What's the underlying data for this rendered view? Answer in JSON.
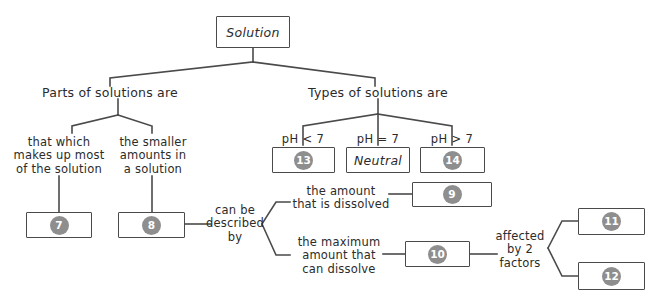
{
  "diagram": {
    "root": {
      "text": "Solution"
    },
    "branches": {
      "left_label": "Parts of solutions are",
      "right_label": "Types of solutions are"
    },
    "left_branch": {
      "child_a_label": "that which\nmakes up most\nof the solution",
      "child_b_label": "the smaller\namounts in\na solution",
      "child_a_answer": "7",
      "child_b_answer": "8"
    },
    "right_branch": {
      "ph_less": "pH < 7",
      "ph_equal": "pH = 7",
      "ph_greater": "pH > 7",
      "ph_less_answer": "13",
      "ph_equal_answer": "Neutral",
      "ph_greater_answer": "14"
    },
    "concentration": {
      "connector_label": "can be\ndescribed\nby",
      "amount_dissolved_label": "the amount\nthat is dissolved",
      "amount_dissolved_answer": "9",
      "max_amount_label": "the maximum\namount that\ncan dissolve",
      "max_amount_answer": "10",
      "factors_label": "affected\nby 2\nfactors",
      "factor_one_answer": "11",
      "factor_two_answer": "12"
    }
  },
  "colors": {
    "line": "#4a4a4a",
    "badge": "#8e8e8e",
    "text": "#2b2b2b",
    "background": "#ffffff"
  }
}
